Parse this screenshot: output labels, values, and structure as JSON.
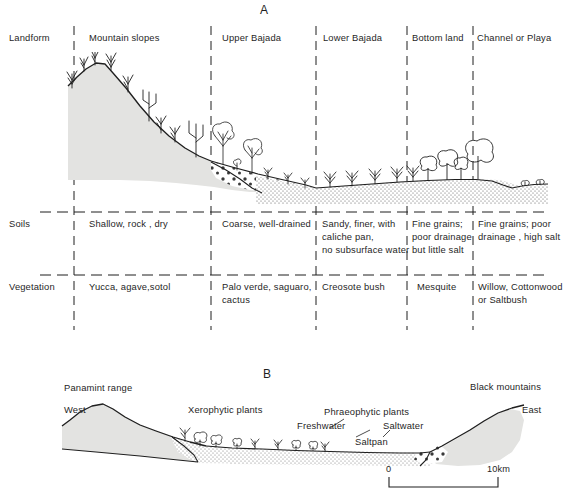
{
  "figure": {
    "panel_a_letter": "A",
    "panel_b_letter": "B"
  },
  "panel_a": {
    "row_labels": {
      "landform": "Landform",
      "soils": "Soils",
      "vegetation": "Vegetation"
    },
    "columns": [
      {
        "id": "mountain-slopes",
        "landform": "Mountain slopes",
        "soils": [
          "Shallow, rock , dry"
        ],
        "vegetation": [
          "Yucca, agave,sotol"
        ]
      },
      {
        "id": "upper-bajada",
        "landform": "Upper Bajada",
        "soils": [
          "Coarse, well-drained"
        ],
        "vegetation": [
          "Palo verde, saguaro,",
          "cactus"
        ]
      },
      {
        "id": "lower-bajada",
        "landform": "Lower Bajada",
        "soils": [
          "Sandy, finer, with",
          "caliche pan,",
          "no subsurface water"
        ],
        "vegetation": [
          "Creosote bush"
        ]
      },
      {
        "id": "bottom-land",
        "landform": "Bottom land",
        "soils": [
          "Fine grains;",
          "poor drainage",
          "but little salt"
        ],
        "vegetation": [
          "Mesquite"
        ]
      },
      {
        "id": "channel-or-playa",
        "landform": "Channel or Playa",
        "soils": [
          "Fine grains; poor",
          "drainage , high salt"
        ],
        "vegetation": [
          "Willow, Cottonwood",
          "or Saltbush"
        ]
      }
    ]
  },
  "panel_b": {
    "west_label": "West",
    "east_label": "East",
    "panamint_label": "Panamint range",
    "black_mountains_label": "Black mountains",
    "xerophytic_label": "Xerophytic plants",
    "phreatophytic_label": "Phraeophytic plants",
    "freshwater_label": "Freshwater",
    "saltwater_label": "Saltwater",
    "saltpan_label": "Saltpan",
    "scale": {
      "left_tick_label": "0",
      "right_tick_label": "10km"
    }
  },
  "colors": {
    "ink": "#1f1f1f",
    "bedrock_fill": "#e2e2e0",
    "alluvium_stipple": "#4a4a4a",
    "paper": "#ffffff"
  }
}
